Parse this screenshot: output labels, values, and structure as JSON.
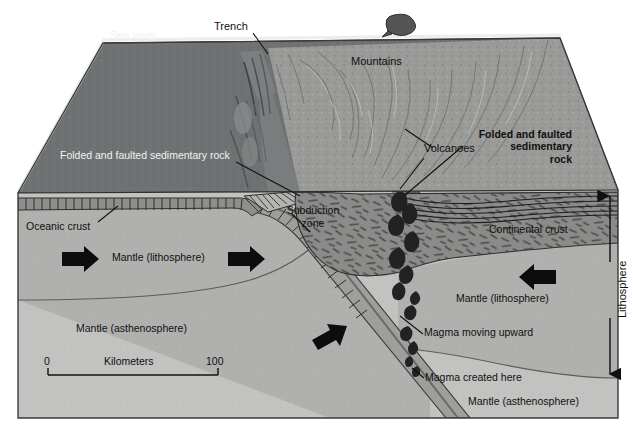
{
  "figure": {
    "kind": "geologic-block-diagram"
  },
  "colors": {
    "ocean_surface": "#6f7273",
    "ocean_surface_dark": "#5d6061",
    "terrain_land": "#9a9a98",
    "oceanic_crust": "#8e8e8c",
    "continental_crust": "#8b8b89",
    "mantle_lithosphere": "#b0b0ae",
    "mantle_asthenosphere": "#c2c2c0",
    "slab": "#a0a09e",
    "outline": "#2a2a2a",
    "label_dark": "#101010",
    "label_white": "#f2f2f2",
    "magma": "#242424",
    "arrow": "#0d0d0d"
  },
  "labels": {
    "sea_level": "Sea level",
    "trench": "Trench",
    "mountains": "Mountains",
    "volcanoes": "Volcanoes",
    "folded_left": "Folded and faulted sedimentary rock",
    "folded_right_line1": "Folded and faulted",
    "folded_right_line2": "sedimentary",
    "folded_right_line3": "rock",
    "oceanic_crust": "Oceanic crust",
    "subduction_zone_line1": "Subduction",
    "subduction_zone_line2": "zone",
    "continental_crust": "Continental crust",
    "mantle_lithosphere_left": "Mantle (lithosphere)",
    "mantle_lithosphere_right": "Mantle (lithosphere)",
    "mantle_asthenosphere_left": "Mantle (asthenosphere)",
    "mantle_asthenosphere_bottom": "Mantle (asthenosphere)",
    "magma_moving_upward": "Magma moving upward",
    "magma_created_here": "Magma created here",
    "lithosphere": "Lithosphere"
  },
  "scale_bar": {
    "left_value": "0",
    "right_value": "100",
    "unit_label": "Kilometers"
  }
}
